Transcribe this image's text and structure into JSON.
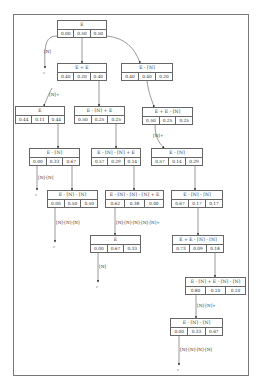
{
  "nodes": [
    {
      "id": "n0",
      "label": "E",
      "values": [
        "0.00",
        "0.50",
        "0.50"
      ]
    },
    {
      "id": "n1",
      "label": "E + E",
      "values": [
        "0.40",
        "0.20",
        "0.40"
      ]
    },
    {
      "id": "n2",
      "label": "E - [N]",
      "values": [
        "0.40",
        "0.40",
        "0.20"
      ]
    },
    {
      "id": "n3",
      "label": "E",
      "values": [
        "0.44",
        "0.11",
        "0.44"
      ]
    },
    {
      "id": "n4",
      "label": "E - [N] + E",
      "values": [
        "0.50",
        "0.25",
        "0.25"
      ]
    },
    {
      "id": "n5",
      "label": "E + E - [N]",
      "values": [
        "0.50",
        "0.25",
        "0.25"
      ]
    },
    {
      "id": "n6",
      "label": "E - [N]",
      "values": [
        "0.00",
        "0.33",
        "0.67"
      ]
    },
    {
      "id": "n7",
      "label": "E - [N] - [N] + E",
      "values": [
        "0.57",
        "0.29",
        "0.14"
      ]
    },
    {
      "id": "n8",
      "label": "E - [N]",
      "values": [
        "0.57",
        "0.14",
        "0.29"
      ]
    },
    {
      "id": "n9",
      "label": "E - [N] - [N]",
      "values": [
        "0.00",
        "0.50",
        "0.50"
      ]
    },
    {
      "id": "n10",
      "label": "E - [N] - [N] - [N] + E",
      "values": [
        "0.62",
        "0.38",
        "0.00"
      ]
    },
    {
      "id": "n11",
      "label": "E - [N] - [N]",
      "values": [
        "0.67",
        "0.17",
        "0.17"
      ]
    },
    {
      "id": "n12",
      "label": "E",
      "values": [
        "0.00",
        "0.67",
        "0.33"
      ]
    },
    {
      "id": "n13",
      "label": "E + E - [N] - [N]",
      "values": [
        "0.73",
        "0.09",
        "0.18"
      ]
    },
    {
      "id": "n14",
      "label": "E - [N] + E - [N] - [N]",
      "values": [
        "0.80",
        "0.10",
        "0.10"
      ]
    },
    {
      "id": "n15",
      "label": "E - [N] - [N]",
      "values": [
        "0.00",
        "0.33",
        "0.67"
      ]
    }
  ],
  "edge_labels": {
    "e0_term": "[N]",
    "e1_3": "[N]+",
    "e5_8": "[N]+",
    "e6_term": "[N]-[N]",
    "e9_term": "[N]-[N]-[N]",
    "e10_12": "[N]-[N]-[N]-[N]-[N]+",
    "e12_term": "[N]",
    "e14_15": "[N]-[N]+",
    "e15_term": "[N]-[N]-[N]-[N]"
  },
  "terminal_symbol": "ε"
}
